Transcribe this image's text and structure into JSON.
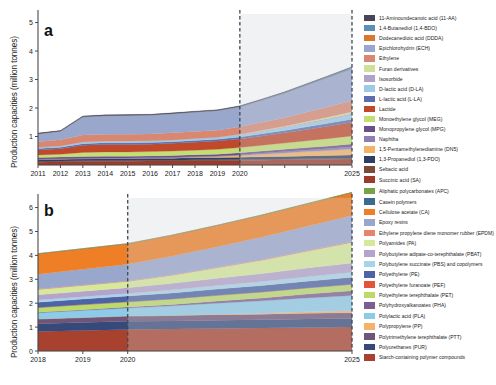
{
  "figure": {
    "width": 496,
    "height": 385,
    "background": "#ffffff"
  },
  "panels": [
    {
      "letter": "a",
      "ylabel": "Production capacities (million tonnes)"
    },
    {
      "letter": "b",
      "ylabel": "Production capacities (million tonnes)"
    }
  ],
  "chart_data": [
    {
      "type": "area",
      "stacked": true,
      "panel": "a",
      "title": "",
      "xlabel": "",
      "ylabel": "Production capacities (million tonnes)",
      "x": [
        2011,
        2012,
        2013,
        2014,
        2015,
        2016,
        2017,
        2018,
        2019,
        2020,
        2021,
        2022,
        2023,
        2024,
        2025
      ],
      "xlim": [
        2011,
        2025
      ],
      "ylim": [
        0,
        5.3
      ],
      "yticks": [
        1,
        2,
        3,
        4,
        5
      ],
      "xticks": [
        2011,
        2012,
        2013,
        2014,
        2015,
        2016,
        2017,
        2018,
        2019,
        2020,
        2021,
        2022,
        2023,
        2024,
        2025
      ],
      "xticklabels": [
        "2011",
        "2012",
        "2013",
        "2014",
        "2015",
        "2016",
        "2017",
        "2018",
        "2019",
        "2020",
        "",
        "",
        "",
        "",
        "2025"
      ],
      "grid": false,
      "legend_position": "right",
      "forecast_start": 2020,
      "forecast_shading": "#cfd3d6",
      "forecast_divider_color": "#3b4a56",
      "series": [
        {
          "name": "Succinic acid (SA)",
          "color": "#9c3a2c",
          "values": [
            0.1,
            0.11,
            0.12,
            0.13,
            0.13,
            0.14,
            0.14,
            0.15,
            0.15,
            0.16,
            0.17,
            0.18,
            0.19,
            0.2,
            0.21
          ]
        },
        {
          "name": "Sebacic acid",
          "color": "#7d4a3a",
          "values": [
            0.03,
            0.03,
            0.03,
            0.03,
            0.03,
            0.03,
            0.03,
            0.03,
            0.03,
            0.03,
            0.03,
            0.03,
            0.03,
            0.03,
            0.03
          ]
        },
        {
          "name": "1,3-Propanediol (1,3-PDO)",
          "color": "#2e3f63",
          "values": [
            0.06,
            0.06,
            0.07,
            0.07,
            0.07,
            0.07,
            0.07,
            0.08,
            0.08,
            0.08,
            0.09,
            0.09,
            0.1,
            0.1,
            0.11
          ]
        },
        {
          "name": "1,5-Pentamethylenediamine (DN5)",
          "color": "#f4b266",
          "values": [
            0.0,
            0.0,
            0.0,
            0.0,
            0.0,
            0.0,
            0.01,
            0.02,
            0.04,
            0.06,
            0.09,
            0.12,
            0.15,
            0.18,
            0.21
          ]
        },
        {
          "name": "Naphtha",
          "color": "#8d7fb5",
          "values": [
            0.02,
            0.02,
            0.02,
            0.02,
            0.02,
            0.02,
            0.02,
            0.02,
            0.02,
            0.03,
            0.04,
            0.05,
            0.06,
            0.07,
            0.08
          ]
        },
        {
          "name": "Monopropylene glycol (MPG)",
          "color": "#6b4f8a",
          "values": [
            0.05,
            0.06,
            0.06,
            0.06,
            0.06,
            0.06,
            0.06,
            0.06,
            0.06,
            0.07,
            0.07,
            0.08,
            0.08,
            0.09,
            0.1
          ]
        },
        {
          "name": "Monoethylene glycol (MEG)",
          "color": "#c3de72",
          "values": [
            0.09,
            0.1,
            0.14,
            0.15,
            0.15,
            0.15,
            0.16,
            0.16,
            0.17,
            0.18,
            0.2,
            0.22,
            0.24,
            0.26,
            0.28
          ]
        },
        {
          "name": "Lactide",
          "color": "#c0492c",
          "values": [
            0.18,
            0.19,
            0.25,
            0.26,
            0.26,
            0.26,
            0.27,
            0.28,
            0.29,
            0.3,
            0.33,
            0.36,
            0.4,
            0.44,
            0.48
          ]
        },
        {
          "name": "L-lactic acid (L-LA)",
          "color": "#5b6fae",
          "values": [
            0.05,
            0.05,
            0.06,
            0.06,
            0.06,
            0.06,
            0.06,
            0.06,
            0.06,
            0.07,
            0.08,
            0.08,
            0.09,
            0.1,
            0.11
          ]
        },
        {
          "name": "D-lactic acid (D-LA)",
          "color": "#9ecae8",
          "values": [
            0.03,
            0.04,
            0.05,
            0.05,
            0.05,
            0.05,
            0.05,
            0.06,
            0.06,
            0.07,
            0.08,
            0.1,
            0.12,
            0.14,
            0.16
          ]
        },
        {
          "name": "Isosorbide",
          "color": "#b0a3c8",
          "values": [
            0.01,
            0.01,
            0.01,
            0.01,
            0.01,
            0.01,
            0.01,
            0.01,
            0.01,
            0.02,
            0.02,
            0.02,
            0.03,
            0.03,
            0.04
          ]
        },
        {
          "name": "Furan derivatives",
          "color": "#cfe09b",
          "values": [
            0.0,
            0.0,
            0.0,
            0.0,
            0.0,
            0.0,
            0.0,
            0.0,
            0.0,
            0.01,
            0.02,
            0.03,
            0.04,
            0.05,
            0.06
          ]
        },
        {
          "name": "Ethylene",
          "color": "#d98770",
          "values": [
            0.2,
            0.22,
            0.24,
            0.24,
            0.24,
            0.24,
            0.25,
            0.25,
            0.25,
            0.26,
            0.28,
            0.3,
            0.33,
            0.36,
            0.39
          ]
        },
        {
          "name": "Epichlorohydrin (ECH)",
          "color": "#9aa7cd",
          "values": [
            0.28,
            0.3,
            0.64,
            0.65,
            0.66,
            0.66,
            0.67,
            0.68,
            0.69,
            0.7,
            0.78,
            0.86,
            0.95,
            1.04,
            1.12
          ]
        },
        {
          "name": "Dodecanedioic acid (DDDA)",
          "color": "#d9772e",
          "values": [
            0.0,
            0.0,
            0.0,
            0.0,
            0.0,
            0.0,
            0.0,
            0.0,
            0.0,
            0.0,
            0.0,
            0.0,
            0.0,
            0.0,
            0.0
          ]
        },
        {
          "name": "1,4-Butanediol (1,4-BDO)",
          "color": "#5b8fb5",
          "values": [
            0.0,
            0.0,
            0.01,
            0.01,
            0.01,
            0.01,
            0.01,
            0.01,
            0.01,
            0.02,
            0.02,
            0.03,
            0.03,
            0.04,
            0.05
          ]
        },
        {
          "name": "11-Aminoundecanoic acid (11-AA)",
          "color": "#4a4458",
          "values": [
            0.02,
            0.02,
            0.02,
            0.02,
            0.02,
            0.02,
            0.02,
            0.02,
            0.02,
            0.02,
            0.02,
            0.02,
            0.02,
            0.02,
            0.02
          ]
        }
      ],
      "totals": [
        1.32,
        1.41,
        2.12,
        2.19,
        2.21,
        2.23,
        2.29,
        2.37,
        2.46,
        2.57,
        3.02,
        3.47,
        3.96,
        4.49,
        5.0
      ]
    },
    {
      "type": "area",
      "stacked": true,
      "panel": "b",
      "title": "",
      "xlabel": "",
      "ylabel": "Production capacities (million tonnes)",
      "x": [
        2018,
        2019,
        2020,
        2021,
        2022,
        2023,
        2024,
        2025
      ],
      "xlim": [
        2018,
        2025
      ],
      "ylim": [
        0,
        6.4
      ],
      "yticks": [
        0,
        1,
        2,
        3,
        4,
        5,
        6
      ],
      "xticks": [
        2018,
        2019,
        2020,
        2025
      ],
      "xticklabels": [
        "2018",
        "2019",
        "2020",
        "2025"
      ],
      "grid": false,
      "legend_position": "right",
      "forecast_start": 2020,
      "forecast_shading": "#cfd3d6",
      "forecast_divider_color": "#3b4a56",
      "series": [
        {
          "name": "Starch-containing polymer compounds",
          "color": "#a8412e",
          "values": [
            0.82,
            0.86,
            0.9,
            0.92,
            0.94,
            0.96,
            0.98,
            1.0
          ]
        },
        {
          "name": "Polyurethanes (PUR)",
          "color": "#35497a",
          "values": [
            0.32,
            0.33,
            0.34,
            0.34,
            0.35,
            0.35,
            0.36,
            0.36
          ]
        },
        {
          "name": "Polytrimethylene terephthalate (PTT)",
          "color": "#6f5577",
          "values": [
            0.2,
            0.21,
            0.22,
            0.22,
            0.23,
            0.23,
            0.24,
            0.24
          ]
        },
        {
          "name": "Polypropylene (PP)",
          "color": "#f6b26b",
          "values": [
            0.0,
            0.0,
            0.0,
            0.01,
            0.02,
            0.04,
            0.06,
            0.08
          ]
        },
        {
          "name": "Polylactic acid (PLA)",
          "color": "#8ecbe8",
          "values": [
            0.26,
            0.3,
            0.34,
            0.4,
            0.46,
            0.52,
            0.58,
            0.64
          ]
        },
        {
          "name": "Polyhydroxyalkanoates (PHA)",
          "color": "#7b5f91",
          "values": [
            0.02,
            0.03,
            0.04,
            0.06,
            0.09,
            0.12,
            0.16,
            0.2
          ]
        },
        {
          "name": "Polyethylene terephthalate (PET)",
          "color": "#bcd96a",
          "values": [
            0.2,
            0.21,
            0.22,
            0.23,
            0.24,
            0.25,
            0.26,
            0.27
          ]
        },
        {
          "name": "Polyethylene furanoate (PEF)",
          "color": "#e2553a",
          "values": [
            0.0,
            0.0,
            0.0,
            0.0,
            0.0,
            0.0,
            0.0,
            0.0
          ]
        },
        {
          "name": "Polyethylene (PE)",
          "color": "#4d63a5",
          "values": [
            0.22,
            0.23,
            0.24,
            0.25,
            0.26,
            0.27,
            0.28,
            0.29
          ]
        },
        {
          "name": "Polybutylene succinate (PBS) and copolymers",
          "color": "#a8d4ea",
          "values": [
            0.09,
            0.1,
            0.11,
            0.13,
            0.15,
            0.17,
            0.19,
            0.21
          ]
        },
        {
          "name": "Polybutylene adipate-co-terephthalate (PBAT)",
          "color": "#b4a4cc",
          "values": [
            0.22,
            0.23,
            0.24,
            0.27,
            0.3,
            0.33,
            0.36,
            0.39
          ]
        },
        {
          "name": "Polyamides (PA)",
          "color": "#d6e89a",
          "values": [
            0.22,
            0.24,
            0.26,
            0.34,
            0.44,
            0.56,
            0.7,
            0.86
          ]
        },
        {
          "name": "Ethylene propylene diene monomer rubber (EPDM)",
          "color": "#e8846c",
          "values": [
            0.02,
            0.02,
            0.02,
            0.02,
            0.02,
            0.03,
            0.03,
            0.03
          ]
        },
        {
          "name": "Epoxy resins",
          "color": "#9aa7cd",
          "values": [
            0.62,
            0.66,
            0.7,
            0.78,
            0.86,
            0.94,
            1.02,
            1.1
          ]
        },
        {
          "name": "Cellulose acetate (CA)",
          "color": "#ef7f26",
          "values": [
            0.86,
            0.86,
            0.86,
            0.88,
            0.9,
            0.92,
            0.94,
            0.96
          ]
        },
        {
          "name": "Casein polymers",
          "color": "#3a6a8e",
          "values": [
            0.0,
            0.0,
            0.0,
            0.0,
            0.0,
            0.0,
            0.0,
            0.0
          ]
        },
        {
          "name": "Aliphatic polycarbonates (APC)",
          "color": "#77a246",
          "values": [
            0.0,
            0.0,
            0.0,
            0.0,
            0.0,
            0.01,
            0.01,
            0.01
          ]
        }
      ],
      "totals": [
        3.93,
        4.13,
        4.36,
        4.82,
        5.34,
        5.92,
        6.55,
        7.24
      ]
    }
  ],
  "legend_a": {
    "items": [
      {
        "label": "11-Aminoundecanoic acid (11-AA)",
        "color": "#4a4458"
      },
      {
        "label": "1,4-Butanediol (1,4-BDO)",
        "color": "#5b8fb5"
      },
      {
        "label": "Dodecanedioic acid (DDDA)",
        "color": "#d9772e"
      },
      {
        "label": "Epichlorohydrin (ECH)",
        "color": "#9aa7cd"
      },
      {
        "label": "Ethylene",
        "color": "#d98770"
      },
      {
        "label": "Furan derivatives",
        "color": "#cfe09b"
      },
      {
        "label": "Isosorbide",
        "color": "#b0a3c8"
      },
      {
        "label": "D-lactic acid (D-LA)",
        "color": "#9ecae8"
      },
      {
        "label": "L-lactic acid (L-LA)",
        "color": "#5b6fae"
      },
      {
        "label": "Lactide",
        "color": "#c0492c"
      },
      {
        "label": "Monoethylene glycol (MEG)",
        "color": "#c3de72"
      },
      {
        "label": "Monopropylene glycol (MPG)",
        "color": "#6b4f8a"
      },
      {
        "label": "Naphtha",
        "color": "#8d7fb5"
      },
      {
        "label": "1,5-Pentamethylenediamine (DN5)",
        "color": "#f4b266"
      },
      {
        "label": "1,3-Propanediol (1,3-PDO)",
        "color": "#2e3f63"
      },
      {
        "label": "Sebacic acid",
        "color": "#7d4a3a"
      },
      {
        "label": "Succinic acid (SA)",
        "color": "#9c3a2c"
      }
    ]
  },
  "legend_b": {
    "items": [
      {
        "label": "Aliphatic polycarbonates (APC)",
        "color": "#77a246"
      },
      {
        "label": "Casein polymers",
        "color": "#3a6a8e"
      },
      {
        "label": "Cellulose acetate (CA)",
        "color": "#ef7f26"
      },
      {
        "label": "Epoxy resins",
        "color": "#9aa7cd"
      },
      {
        "label": "Ethylene propylene diene monomer rubber (EPDM)",
        "color": "#e8846c"
      },
      {
        "label": "Polyamides (PA)",
        "color": "#d6e89a"
      },
      {
        "label": "Polybutylene adipate-co-terephthalate (PBAT)",
        "color": "#b4a4cc"
      },
      {
        "label": "Polybutylene succinate (PBS) and copolymers",
        "color": "#a8d4ea"
      },
      {
        "label": "Polyethylene (PE)",
        "color": "#4d63a5"
      },
      {
        "label": "Polyethylene furanoate (PEF)",
        "color": "#e2553a"
      },
      {
        "label": "Polyethylene terephthalate (PET)",
        "color": "#bcd96a"
      },
      {
        "label": "Polyhydroxyalkanoates (PHA)",
        "color": "#7b5f91"
      },
      {
        "label": "Polylactic acid (PLA)",
        "color": "#8ecbe8"
      },
      {
        "label": "Polypropylene (PP)",
        "color": "#f6b26b"
      },
      {
        "label": "Polytrimethylene terephthalate (PTT)",
        "color": "#6f5577"
      },
      {
        "label": "Polyurethanes (PUR)",
        "color": "#35497a"
      },
      {
        "label": "Starch-containing polymer compounds",
        "color": "#a8412e"
      }
    ]
  }
}
